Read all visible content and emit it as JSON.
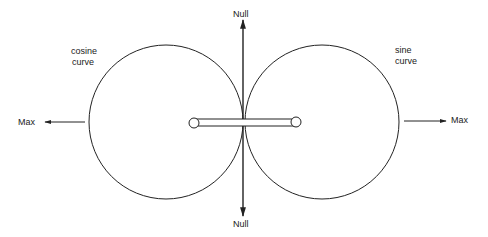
{
  "diagram": {
    "type": "dipole antenna radiation pattern",
    "labels": {
      "null_top": "Null",
      "null_bottom": "Null",
      "max_left": "Max",
      "max_right": "Max",
      "cosine_line1": "cosine",
      "cosine_line2": "curve",
      "sine_line1": "sine",
      "sine_line2": "curve"
    },
    "lobes": [
      {
        "name": "cosine curve",
        "side": "left"
      },
      {
        "name": "sine curve",
        "side": "right"
      }
    ],
    "colors": {
      "stroke": "#222222",
      "background": "#ffffff"
    }
  }
}
